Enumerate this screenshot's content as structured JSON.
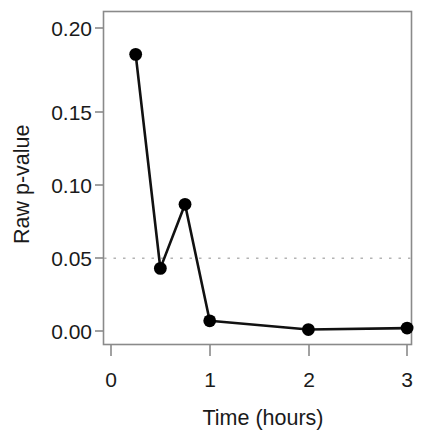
{
  "chart_data": {
    "type": "line",
    "title": "",
    "subtitle": "",
    "xlabel": "Time (hours)",
    "ylabel": "Raw p-value",
    "x": [
      0.25,
      0.5,
      0.75,
      1,
      2,
      3
    ],
    "y": [
      0.19,
      0.043,
      0.087,
      0.007,
      0.001,
      0.002
    ],
    "series": [
      {
        "name": "Raw p-value",
        "x": [
          0.25,
          0.5,
          0.75,
          1,
          2,
          3
        ],
        "values": [
          0.19,
          0.043,
          0.087,
          0.007,
          0.001,
          0.002
        ],
        "color": "#000000",
        "marker": "filled-circle",
        "line_style": "solid"
      }
    ],
    "xlim": [
      -0.08,
      3.05
    ],
    "ylim": [
      -0.007,
      0.2095
    ],
    "xticks": [
      0,
      1,
      2,
      3
    ],
    "xticklabels": [
      "0",
      "1",
      "2",
      "3"
    ],
    "yticks": [
      0.0,
      0.05,
      0.1,
      0.15,
      0.2
    ],
    "yticklabels": [
      "0.00",
      "0.05",
      "0.10",
      "0.15",
      "0.20"
    ],
    "grid": false,
    "legend": null,
    "legend_position": "none",
    "annotations": [
      {
        "type": "hline",
        "name": "significance-threshold-line",
        "y": 0.05,
        "style": "dotted",
        "color": "#b4b4b4",
        "label": ""
      }
    ],
    "frame": "box",
    "background": "#ffffff"
  },
  "axes": {
    "y_label": "Raw p-value",
    "x_label": "Time (hours)",
    "y_tick_labels": [
      "0.20",
      "0.15",
      "0.10",
      "0.05",
      "0.00"
    ],
    "x_tick_labels": [
      "0",
      "1",
      "2",
      "3"
    ]
  },
  "colors": {
    "line": "#000000",
    "marker": "#000000",
    "frame": "#808080",
    "threshold": "#b4b4b4",
    "text": "#1a1a1a",
    "background": "#ffffff"
  }
}
